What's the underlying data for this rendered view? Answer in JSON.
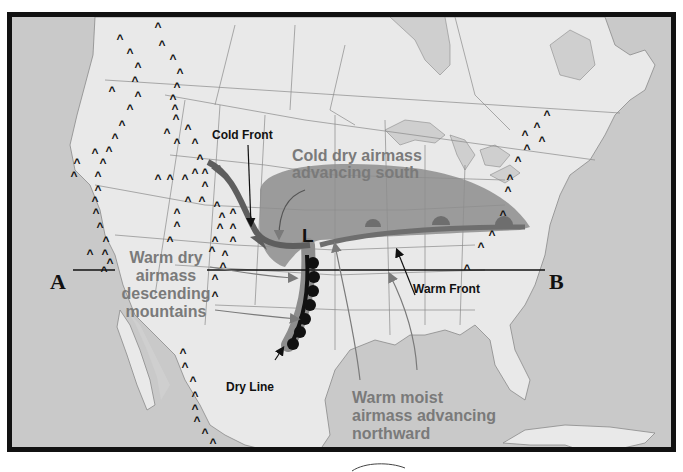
{
  "diagram": {
    "type": "weather-map",
    "region": "North America (United States)",
    "labels": {
      "cold_front": "Cold Front",
      "warm_front": "Warm Front",
      "dry_line": "Dry Line",
      "low_pressure": "L",
      "cold_airmass_line1": "Cold dry airmass",
      "cold_airmass_line2": "advancing south",
      "warm_dry_line1": "Warm dry",
      "warm_dry_line2": "airmass",
      "warm_dry_line3": "descending",
      "warm_dry_line4": "mountains",
      "warm_moist_line1": "Warm moist",
      "warm_moist_line2": "airmass advancing",
      "warm_moist_line3": "northward",
      "cross_section_start": "A",
      "cross_section_end": "B"
    },
    "symbols": {
      "mountain_marker": "^",
      "cold_front_symbol": "triangles",
      "warm_front_symbol": "semicircles",
      "dry_line_symbol": "semicircles"
    },
    "colors": {
      "ocean": "#c9c9c9",
      "land": "#e9e9e9",
      "lakes": "#cfcfcf",
      "cold_airmass": "#8d8d8d",
      "fronts": "#6e6e6e",
      "dry_line": "#111111",
      "frame": "#111111",
      "gray_text": "#7a7a7a"
    }
  }
}
